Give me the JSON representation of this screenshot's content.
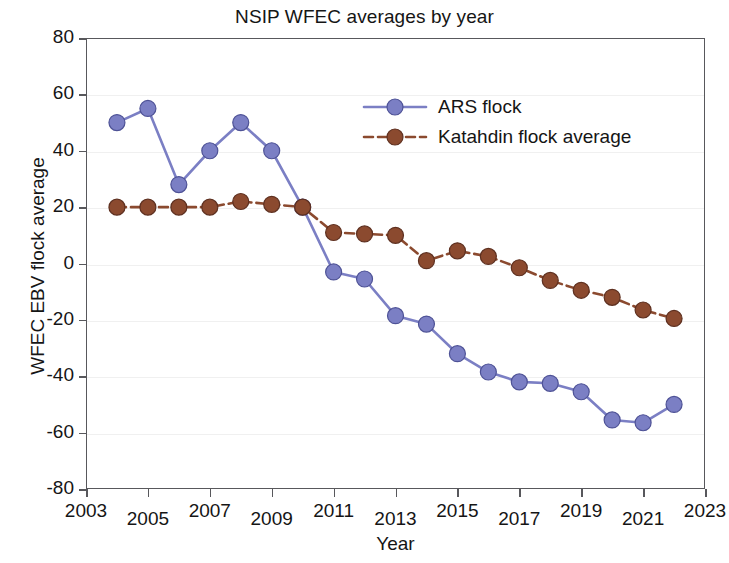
{
  "chart_data": {
    "type": "line",
    "title": "NSIP WFEC averages by year",
    "xlabel": "Year",
    "ylabel": "WFEC EBV flock average",
    "xlim": [
      2003,
      2023
    ],
    "ylim": [
      -80,
      80
    ],
    "grid": true,
    "legend_position": "upper-right-inside",
    "x_ticks": [
      "2003",
      "2005",
      "2007",
      "2009",
      "2011",
      "2013",
      "2015",
      "2017",
      "2019",
      "2021",
      "2023"
    ],
    "x_tick_values": [
      2003,
      2005,
      2007,
      2009,
      2011,
      2013,
      2015,
      2017,
      2019,
      2021,
      2023
    ],
    "y_ticks": [
      "80",
      "60",
      "40",
      "20",
      "0",
      "-20",
      "-40",
      "-60",
      "-80"
    ],
    "y_tick_values": [
      80,
      60,
      40,
      20,
      0,
      -20,
      -40,
      -60,
      -80
    ],
    "x": [
      2004,
      2005,
      2006,
      2007,
      2008,
      2009,
      2010,
      2011,
      2012,
      2013,
      2014,
      2015,
      2016,
      2017,
      2018,
      2019,
      2020,
      2021,
      2022
    ],
    "series": [
      {
        "name": "ARS flock",
        "color": "#7b7fc4",
        "line_style": "solid",
        "marker": "circle",
        "values": [
          50,
          55,
          28,
          40,
          50,
          40,
          20,
          -3,
          -5.5,
          -18.5,
          -21.5,
          -32,
          -38.5,
          -42,
          -42.5,
          -45.5,
          -55.5,
          -56.5,
          -50
        ]
      },
      {
        "name": "Katahdin flock average",
        "color": "#8b4a2f",
        "line_style": "dashed",
        "marker": "circle",
        "values": [
          20,
          20,
          20,
          20,
          22,
          21,
          20,
          11,
          10.5,
          10,
          1,
          4.5,
          2.5,
          -1.5,
          -6,
          -9.5,
          -12,
          -16.5,
          -19.5
        ]
      }
    ]
  }
}
